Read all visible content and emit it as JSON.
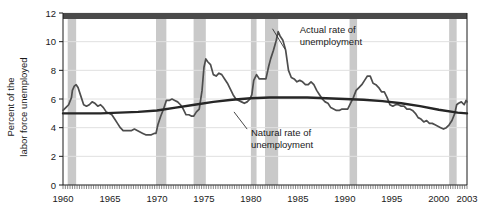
{
  "chart_data": {
    "type": "line",
    "title": "",
    "xlabel": "",
    "ylabel": "Percent of the labor force unemployed",
    "ylabel_line1": "Percent of the",
    "ylabel_line2": "labor force unemployed",
    "xlim": [
      1960,
      2003
    ],
    "ylim": [
      0,
      12
    ],
    "yticks": [
      0,
      2,
      4,
      6,
      8,
      10,
      12
    ],
    "ytick_labels": [
      "0",
      "2",
      "4",
      "6",
      "8",
      "10",
      "12"
    ],
    "xticks": [
      1960,
      1965,
      1970,
      1975,
      1980,
      1985,
      1990,
      1995,
      2000,
      2003
    ],
    "xtick_labels": [
      "1960",
      "1965",
      "1970",
      "1975",
      "1980",
      "1985",
      "1990",
      "1995",
      "2000",
      "2003"
    ],
    "grid": "horizontal",
    "legend_position": "inline-annotations",
    "annotations": [
      {
        "name": "actual-rate-annotation",
        "line1": "Actual rate of",
        "line2": "unemployment",
        "x": 1985.2,
        "y": 10.6,
        "leader_from": [
          1983.6,
          9.5
        ],
        "leader_to": [
          1982.3,
          10.9
        ]
      },
      {
        "name": "natural-rate-annotation",
        "line1": "Natural rate of",
        "line2": "unemployment",
        "x": 1980.0,
        "y": 3.45,
        "leader_from": [
          1979.6,
          3.9
        ],
        "leader_to": [
          1978.2,
          5.1
        ]
      }
    ],
    "recession_bands": {
      "name": "recession-shading",
      "color": "#c9c9c9",
      "spans": [
        [
          1960.5,
          1961.4
        ],
        [
          1969.9,
          1971.0
        ],
        [
          1973.9,
          1975.2
        ],
        [
          1980.0,
          1980.6
        ],
        [
          1981.5,
          1982.9
        ],
        [
          1990.5,
          1991.3
        ],
        [
          2001.1,
          2001.9
        ]
      ]
    },
    "series": [
      {
        "name": "Actual rate of unemployment",
        "color": "#4d4d4d",
        "linewidth": 1.7,
        "points": [
          [
            1960.0,
            5.2
          ],
          [
            1960.3,
            5.4
          ],
          [
            1960.6,
            5.6
          ],
          [
            1960.9,
            6.1
          ],
          [
            1961.0,
            6.6
          ],
          [
            1961.2,
            6.9
          ],
          [
            1961.4,
            7.0
          ],
          [
            1961.6,
            6.8
          ],
          [
            1961.9,
            6.2
          ],
          [
            1962.2,
            5.6
          ],
          [
            1962.5,
            5.5
          ],
          [
            1962.8,
            5.6
          ],
          [
            1963.1,
            5.8
          ],
          [
            1963.4,
            5.7
          ],
          [
            1963.7,
            5.5
          ],
          [
            1964.0,
            5.6
          ],
          [
            1964.3,
            5.4
          ],
          [
            1964.6,
            5.1
          ],
          [
            1964.9,
            5.0
          ],
          [
            1965.2,
            4.9
          ],
          [
            1965.5,
            4.6
          ],
          [
            1965.8,
            4.3
          ],
          [
            1966.1,
            4.0
          ],
          [
            1966.4,
            3.8
          ],
          [
            1966.7,
            3.8
          ],
          [
            1967.0,
            3.8
          ],
          [
            1967.3,
            3.8
          ],
          [
            1967.6,
            3.9
          ],
          [
            1967.9,
            3.8
          ],
          [
            1968.2,
            3.7
          ],
          [
            1968.5,
            3.6
          ],
          [
            1968.8,
            3.5
          ],
          [
            1969.1,
            3.5
          ],
          [
            1969.4,
            3.5
          ],
          [
            1969.7,
            3.6
          ],
          [
            1969.9,
            3.6
          ],
          [
            1970.1,
            4.2
          ],
          [
            1970.4,
            4.8
          ],
          [
            1970.7,
            5.3
          ],
          [
            1971.0,
            5.9
          ],
          [
            1971.3,
            5.9
          ],
          [
            1971.6,
            6.0
          ],
          [
            1971.9,
            5.9
          ],
          [
            1972.2,
            5.8
          ],
          [
            1972.5,
            5.6
          ],
          [
            1972.8,
            5.3
          ],
          [
            1973.1,
            4.9
          ],
          [
            1973.4,
            4.9
          ],
          [
            1973.7,
            4.8
          ],
          [
            1973.9,
            4.8
          ],
          [
            1974.2,
            5.1
          ],
          [
            1974.5,
            5.3
          ],
          [
            1974.8,
            6.6
          ],
          [
            1975.0,
            8.2
          ],
          [
            1975.2,
            8.8
          ],
          [
            1975.4,
            8.6
          ],
          [
            1975.7,
            8.4
          ],
          [
            1976.0,
            7.7
          ],
          [
            1976.3,
            7.6
          ],
          [
            1976.6,
            7.8
          ],
          [
            1976.9,
            7.7
          ],
          [
            1977.2,
            7.4
          ],
          [
            1977.5,
            7.1
          ],
          [
            1977.8,
            6.7
          ],
          [
            1978.1,
            6.3
          ],
          [
            1978.4,
            6.0
          ],
          [
            1978.7,
            5.9
          ],
          [
            1979.0,
            5.8
          ],
          [
            1979.3,
            5.7
          ],
          [
            1979.6,
            5.8
          ],
          [
            1979.9,
            6.0
          ],
          [
            1980.1,
            6.3
          ],
          [
            1980.3,
            7.3
          ],
          [
            1980.6,
            7.7
          ],
          [
            1980.9,
            7.4
          ],
          [
            1981.1,
            7.4
          ],
          [
            1981.4,
            7.4
          ],
          [
            1981.6,
            7.4
          ],
          [
            1981.9,
            8.3
          ],
          [
            1982.1,
            8.8
          ],
          [
            1982.4,
            9.4
          ],
          [
            1982.7,
            10.1
          ],
          [
            1982.9,
            10.7
          ],
          [
            1983.1,
            10.4
          ],
          [
            1983.4,
            10.1
          ],
          [
            1983.7,
            9.4
          ],
          [
            1984.0,
            8.0
          ],
          [
            1984.3,
            7.5
          ],
          [
            1984.6,
            7.4
          ],
          [
            1984.9,
            7.2
          ],
          [
            1985.2,
            7.3
          ],
          [
            1985.5,
            7.2
          ],
          [
            1985.8,
            7.0
          ],
          [
            1986.1,
            7.0
          ],
          [
            1986.4,
            7.2
          ],
          [
            1986.7,
            7.0
          ],
          [
            1987.0,
            6.6
          ],
          [
            1987.3,
            6.3
          ],
          [
            1987.6,
            6.0
          ],
          [
            1987.9,
            5.8
          ],
          [
            1988.2,
            5.7
          ],
          [
            1988.5,
            5.4
          ],
          [
            1988.8,
            5.3
          ],
          [
            1989.1,
            5.2
          ],
          [
            1989.4,
            5.2
          ],
          [
            1989.7,
            5.3
          ],
          [
            1990.0,
            5.3
          ],
          [
            1990.3,
            5.3
          ],
          [
            1990.6,
            5.7
          ],
          [
            1990.9,
            6.1
          ],
          [
            1991.2,
            6.6
          ],
          [
            1991.5,
            6.8
          ],
          [
            1991.8,
            7.0
          ],
          [
            1992.1,
            7.3
          ],
          [
            1992.4,
            7.6
          ],
          [
            1992.7,
            7.6
          ],
          [
            1993.0,
            7.1
          ],
          [
            1993.3,
            7.0
          ],
          [
            1993.6,
            6.8
          ],
          [
            1993.9,
            6.5
          ],
          [
            1994.2,
            6.5
          ],
          [
            1994.5,
            6.1
          ],
          [
            1994.8,
            5.6
          ],
          [
            1995.1,
            5.5
          ],
          [
            1995.4,
            5.6
          ],
          [
            1995.7,
            5.6
          ],
          [
            1996.0,
            5.5
          ],
          [
            1996.3,
            5.5
          ],
          [
            1996.6,
            5.3
          ],
          [
            1996.9,
            5.3
          ],
          [
            1997.2,
            5.2
          ],
          [
            1997.5,
            5.0
          ],
          [
            1997.8,
            4.7
          ],
          [
            1998.1,
            4.6
          ],
          [
            1998.4,
            4.4
          ],
          [
            1998.7,
            4.5
          ],
          [
            1999.0,
            4.3
          ],
          [
            1999.3,
            4.3
          ],
          [
            1999.6,
            4.2
          ],
          [
            1999.9,
            4.1
          ],
          [
            2000.2,
            4.0
          ],
          [
            2000.5,
            3.9
          ],
          [
            2000.8,
            4.0
          ],
          [
            2001.1,
            4.2
          ],
          [
            2001.4,
            4.5
          ],
          [
            2001.7,
            5.0
          ],
          [
            2001.9,
            5.6
          ],
          [
            2002.1,
            5.7
          ],
          [
            2002.4,
            5.8
          ],
          [
            2002.7,
            5.6
          ],
          [
            2002.9,
            5.9
          ],
          [
            2003.0,
            5.8
          ]
        ]
      },
      {
        "name": "Natural rate of unemployment",
        "color": "#262626",
        "linewidth": 2.4,
        "points": [
          [
            1960.0,
            5.0
          ],
          [
            1962.0,
            5.0
          ],
          [
            1964.0,
            5.0
          ],
          [
            1966.0,
            5.05
          ],
          [
            1968.0,
            5.1
          ],
          [
            1970.0,
            5.2
          ],
          [
            1972.0,
            5.4
          ],
          [
            1974.0,
            5.6
          ],
          [
            1976.0,
            5.8
          ],
          [
            1978.0,
            5.95
          ],
          [
            1980.0,
            6.05
          ],
          [
            1982.0,
            6.1
          ],
          [
            1984.0,
            6.1
          ],
          [
            1986.0,
            6.1
          ],
          [
            1988.0,
            6.05
          ],
          [
            1990.0,
            6.0
          ],
          [
            1992.0,
            5.95
          ],
          [
            1994.0,
            5.85
          ],
          [
            1996.0,
            5.7
          ],
          [
            1998.0,
            5.5
          ],
          [
            2000.0,
            5.25
          ],
          [
            2002.0,
            5.05
          ],
          [
            2003.0,
            5.0
          ]
        ]
      }
    ],
    "colors": {
      "background": "#ffffff",
      "plot_background": "#ffffff",
      "axis": "#1a1a1a",
      "top_band": "#4a4a4a",
      "gridline": "#e0e0e0",
      "recession": "#c9c9c9",
      "actual_line": "#4d4d4d",
      "natural_line": "#262626"
    }
  }
}
